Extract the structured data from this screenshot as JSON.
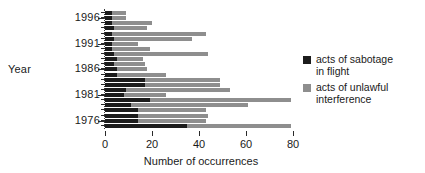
{
  "chart_data": {
    "type": "bar",
    "title": "",
    "subtitle": "",
    "orientation": "horizontal",
    "stacked": true,
    "xlabel": "Number of occurrences",
    "ylabel": "Year",
    "xlim": [
      0,
      80
    ],
    "ylim_labels": [
      "1976",
      "1981",
      "1986",
      "1991",
      "1996"
    ],
    "xticks": [
      0,
      20,
      40,
      60,
      80
    ],
    "xticklabels": [
      "0",
      "20",
      "40",
      "60",
      "80"
    ],
    "grid": false,
    "legend_position": "right",
    "categories": [
      "1997",
      "1996",
      "1995",
      "1994",
      "1993",
      "1992",
      "1991",
      "1990",
      "1989",
      "1988",
      "1987",
      "1986",
      "1985",
      "1984",
      "1983",
      "1982",
      "1981",
      "1980",
      "1979",
      "1978",
      "1977",
      "1976",
      "1975"
    ],
    "series": [
      {
        "name": "acts of sabotage in flight",
        "color": "#1c1c1c",
        "values": [
          3,
          3,
          3,
          4,
          3,
          4,
          3,
          3,
          4,
          5,
          4,
          5,
          5,
          17,
          17,
          9,
          8,
          19,
          11,
          14,
          14,
          14,
          35
        ]
      },
      {
        "name": "acts of unlawful interference",
        "color": "#8e8e8e",
        "values": [
          6,
          6,
          17,
          14,
          40,
          33,
          11,
          16,
          40,
          11,
          13,
          13,
          21,
          32,
          32,
          44,
          18,
          60,
          50,
          29,
          30,
          29,
          44
        ]
      }
    ],
    "totals": [
      9,
      9,
      20,
      18,
      43,
      37,
      14,
      19,
      44,
      16,
      17,
      18,
      26,
      49,
      49,
      53,
      26,
      79,
      61,
      43,
      44,
      43,
      79
    ],
    "bar_rows": [
      {
        "year": "1997",
        "black": 3,
        "total": 9,
        "tick": false
      },
      {
        "year": "1996",
        "black": 3,
        "total": 9,
        "tick": true
      },
      {
        "year": "1995",
        "black": 3,
        "total": 20,
        "tick": false
      },
      {
        "year": "1994",
        "black": 4,
        "total": 18,
        "tick": false
      },
      {
        "year": "1993",
        "black": 3,
        "total": 43,
        "tick": false
      },
      {
        "year": "1992",
        "black": 4,
        "total": 37,
        "tick": false
      },
      {
        "year": "1991",
        "black": 3,
        "total": 14,
        "tick": true
      },
      {
        "year": "1990",
        "black": 3,
        "total": 19,
        "tick": false
      },
      {
        "year": "1989",
        "black": 4,
        "total": 44,
        "tick": false
      },
      {
        "year": "1988",
        "black": 5,
        "total": 16,
        "tick": false
      },
      {
        "year": "1987",
        "black": 4,
        "total": 17,
        "tick": false
      },
      {
        "year": "1986",
        "black": 5,
        "total": 18,
        "tick": true
      },
      {
        "year": "1985",
        "black": 5,
        "total": 26,
        "tick": false
      },
      {
        "year": "1984",
        "black": 17,
        "total": 49,
        "tick": false
      },
      {
        "year": "1983",
        "black": 17,
        "total": 49,
        "tick": false
      },
      {
        "year": "1982",
        "black": 9,
        "total": 53,
        "tick": false
      },
      {
        "year": "1981",
        "black": 8,
        "total": 26,
        "tick": true
      },
      {
        "year": "1980",
        "black": 19,
        "total": 79,
        "tick": false
      },
      {
        "year": "1979",
        "black": 11,
        "total": 61,
        "tick": false
      },
      {
        "year": "1978",
        "black": 14,
        "total": 43,
        "tick": false
      },
      {
        "year": "1977",
        "black": 14,
        "total": 44,
        "tick": false
      },
      {
        "year": "1976",
        "black": 14,
        "total": 43,
        "tick": true
      },
      {
        "year": "1975",
        "black": 35,
        "total": 79,
        "tick": false
      }
    ],
    "year_axis_labels": [
      {
        "text": "1996",
        "row_index": 1
      },
      {
        "text": "1991",
        "row_index": 6
      },
      {
        "text": "1986",
        "row_index": 11
      },
      {
        "text": "1981",
        "row_index": 16
      },
      {
        "text": "1976",
        "row_index": 21
      }
    ],
    "legend": [
      {
        "label_line1": "acts of sabotage",
        "label_line2": "in flight",
        "color": "#1c1c1c",
        "swatch": "black-square-icon"
      },
      {
        "label_line1": "acts of unlawful",
        "label_line2": "interference",
        "color": "#8e8e8e",
        "swatch": "gray-square-icon"
      }
    ]
  },
  "axes": {
    "y_title": "Year",
    "x_title": "Number of occurrences"
  },
  "colors": {
    "sabotage": "#1c1c1c",
    "interference": "#8e8e8e",
    "axis": "#2a2a2a",
    "background": "#ffffff"
  }
}
